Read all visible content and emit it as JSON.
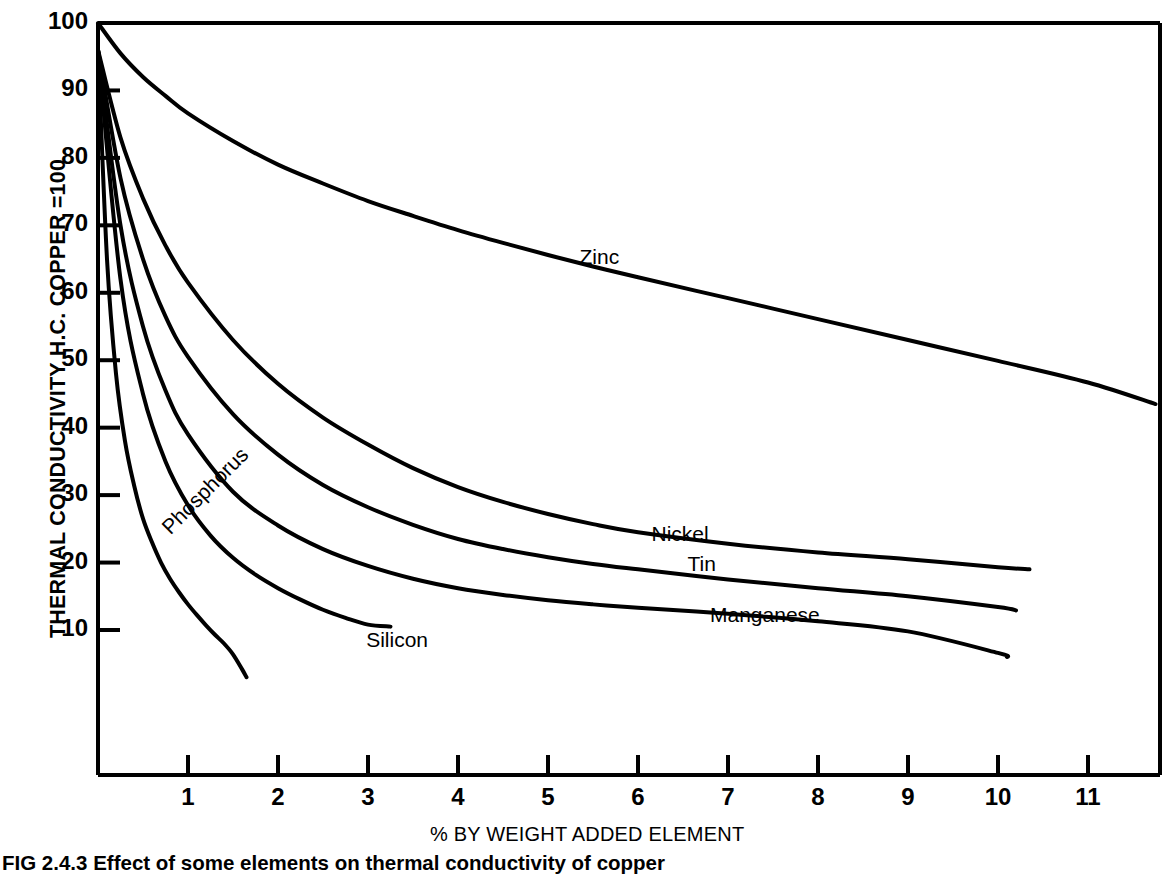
{
  "figure": {
    "caption": "FIG 2.4.3 Effect of some elements on thermal conductivity of copper",
    "background_color": "#ffffff",
    "line_color": "#000000"
  },
  "chart_data": {
    "type": "line",
    "title": "",
    "xlabel": "% BY WEIGHT ADDED ELEMENT",
    "ylabel": "THERMAL CONDUCTIVITY H.C. COPPER =100",
    "xlim": [
      0,
      11.8
    ],
    "ylim": [
      0,
      100
    ],
    "xticks": [
      1,
      2,
      3,
      4,
      5,
      6,
      7,
      8,
      9,
      10,
      11
    ],
    "yticks": [
      10,
      20,
      30,
      40,
      50,
      60,
      70,
      80,
      90,
      100
    ],
    "xtick_labels": [
      "1",
      "2",
      "3",
      "4",
      "5",
      "6",
      "7",
      "8",
      "9",
      "10",
      "11"
    ],
    "ytick_labels": [
      "10",
      "20",
      "30",
      "40",
      "50",
      "60",
      "70",
      "80",
      "90",
      "100"
    ],
    "grid": false,
    "legend": "inline-curve-labels",
    "series": [
      {
        "name": "Zinc",
        "label_x": 5.35,
        "label_y": 65.0,
        "label_rotation": 0,
        "x": [
          0.0,
          0.25,
          0.5,
          0.75,
          1.0,
          1.5,
          2.0,
          2.5,
          3.0,
          3.5,
          4.0,
          4.5,
          5.0,
          5.5,
          6.0,
          7.0,
          8.0,
          9.0,
          10.0,
          11.0,
          11.75
        ],
        "y": [
          100.0,
          95.5,
          92.0,
          89.2,
          86.6,
          82.5,
          79.0,
          76.2,
          73.6,
          71.4,
          69.3,
          67.4,
          65.6,
          63.9,
          62.3,
          59.2,
          56.1,
          53.0,
          49.9,
          46.7,
          43.5
        ]
      },
      {
        "name": "Nickel",
        "label_x": 6.15,
        "label_y": 24.0,
        "label_rotation": 0,
        "x": [
          0.0,
          0.25,
          0.5,
          0.75,
          1.0,
          1.5,
          2.0,
          2.5,
          3.0,
          3.5,
          4.0,
          4.5,
          5.0,
          5.5,
          6.0,
          7.0,
          8.0,
          9.0,
          10.0,
          10.35
        ],
        "y": [
          96.0,
          83.0,
          74.0,
          67.0,
          61.5,
          53.0,
          46.5,
          41.5,
          37.5,
          34.0,
          31.2,
          29.0,
          27.2,
          25.7,
          24.5,
          22.8,
          21.5,
          20.5,
          19.3,
          19.0
        ]
      },
      {
        "name": "Tin",
        "label_x": 6.55,
        "label_y": 19.5,
        "label_rotation": 0,
        "x": [
          0.0,
          0.25,
          0.5,
          0.75,
          1.0,
          1.5,
          2.0,
          2.5,
          3.0,
          3.5,
          4.0,
          4.5,
          5.0,
          5.5,
          6.0,
          7.0,
          8.0,
          9.0,
          10.0,
          10.2
        ],
        "y": [
          96.0,
          77.0,
          65.0,
          56.5,
          50.5,
          42.0,
          36.0,
          31.5,
          28.2,
          25.6,
          23.5,
          22.0,
          20.8,
          19.8,
          19.0,
          17.5,
          16.2,
          15.0,
          13.4,
          12.9
        ]
      },
      {
        "name": "Manganese",
        "label_x": 6.8,
        "label_y": 12.0,
        "label_rotation": 0,
        "x": [
          0.0,
          0.25,
          0.5,
          0.75,
          1.0,
          1.5,
          2.0,
          2.5,
          3.0,
          3.5,
          4.0,
          4.5,
          5.0,
          5.5,
          6.0,
          7.0,
          8.0,
          9.0,
          10.0,
          10.1
        ],
        "y": [
          96.0,
          70.0,
          55.0,
          45.5,
          39.0,
          30.5,
          25.5,
          22.0,
          19.5,
          17.6,
          16.2,
          15.2,
          14.4,
          13.8,
          13.3,
          12.4,
          11.3,
          9.8,
          6.6,
          6.0
        ]
      },
      {
        "name": "Silicon",
        "label_x": 2.98,
        "label_y": 8.2,
        "label_rotation": 0,
        "x": [
          0.0,
          0.25,
          0.5,
          0.75,
          1.0,
          1.25,
          1.5,
          1.75,
          2.0,
          2.25,
          2.5,
          2.75,
          3.0,
          3.25
        ],
        "y": [
          96.0,
          62.0,
          45.0,
          35.0,
          28.5,
          24.0,
          20.7,
          18.2,
          16.2,
          14.5,
          13.0,
          11.8,
          10.8,
          10.5
        ]
      },
      {
        "name": "Phosphorus",
        "label_x": 0.66,
        "label_y": 24.0,
        "label_rotation": -45,
        "x": [
          0.0,
          0.1,
          0.2,
          0.3,
          0.4,
          0.5,
          0.6,
          0.7,
          0.8,
          0.9,
          1.0,
          1.1,
          1.2,
          1.3,
          1.4,
          1.5,
          1.6,
          1.65
        ],
        "y": [
          96.0,
          65.0,
          48.0,
          38.0,
          31.5,
          26.5,
          23.0,
          20.0,
          17.6,
          15.6,
          13.8,
          12.2,
          10.7,
          9.3,
          8.0,
          6.4,
          4.2,
          3.0
        ]
      }
    ]
  }
}
